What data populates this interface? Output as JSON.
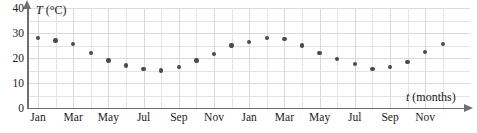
{
  "chart_data": {
    "type": "scatter",
    "title": "",
    "xlabel": "t (months)",
    "ylabel": "T (°C)",
    "ylim": [
      0,
      40
    ],
    "yticks": [
      0,
      10,
      20,
      30,
      40
    ],
    "xticks_labels": [
      "Jan",
      "Mar",
      "May",
      "Jul",
      "Sep",
      "Nov",
      "Jan",
      "Mar",
      "May",
      "Jul",
      "Sep",
      "Nov"
    ],
    "grid": true,
    "legend": null,
    "categories": [
      "Jan",
      "Feb",
      "Mar",
      "Apr",
      "May",
      "Jun",
      "Jul",
      "Aug",
      "Sep",
      "Oct",
      "Nov",
      "Dec",
      "Jan",
      "Feb",
      "Mar",
      "Apr",
      "May",
      "Jun",
      "Jul",
      "Aug",
      "Sep",
      "Oct",
      "Nov",
      "Dec"
    ],
    "x": [
      1,
      2,
      3,
      4,
      5,
      6,
      7,
      8,
      9,
      10,
      11,
      12,
      13,
      14,
      15,
      16,
      17,
      18,
      19,
      20,
      21,
      22,
      23,
      24
    ],
    "values": [
      28,
      27,
      25.5,
      22,
      19,
      17,
      15.5,
      15,
      16.5,
      19,
      21.5,
      25,
      26.5,
      28,
      27.5,
      25,
      22,
      19.5,
      17.5,
      15.5,
      16.5,
      18.5,
      22.5,
      25.5
    ],
    "point_color": "#4a4a52",
    "grid_color": "#e2e4e8",
    "axis_color": "#6f6f72"
  },
  "axes": {
    "y_title_symbol": "T",
    "y_title_unit": " (°C)",
    "x_title_symbol": "t",
    "x_title_unit": " (months)"
  }
}
